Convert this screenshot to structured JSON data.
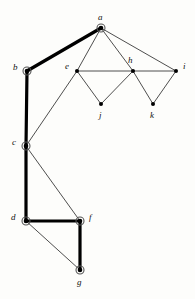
{
  "figure": {
    "width": 195,
    "height": 299,
    "background_color": "#fdfdfb",
    "edge_color_normal": "#3a3a3a",
    "edge_color_tree": "#000000",
    "node_fill": "#000000",
    "node_ring_color": "#555555",
    "label_color": "#111111"
  },
  "nodes": [
    {
      "id": "a",
      "label": "a",
      "x": 101,
      "y": 28,
      "label_x": 98,
      "label_y": 13,
      "ringed": true
    },
    {
      "id": "b",
      "label": "b",
      "x": 27,
      "y": 71,
      "label_x": 13,
      "label_y": 63,
      "ringed": true
    },
    {
      "id": "c",
      "label": "c",
      "x": 26,
      "y": 146,
      "label_x": 12,
      "label_y": 138,
      "ringed": true
    },
    {
      "id": "d",
      "label": "d",
      "x": 26,
      "y": 221,
      "label_x": 11,
      "label_y": 213,
      "ringed": true
    },
    {
      "id": "e",
      "label": "e",
      "x": 77,
      "y": 71,
      "label_x": 65,
      "label_y": 62,
      "ringed": false
    },
    {
      "id": "f",
      "label": "f",
      "x": 80,
      "y": 221,
      "label_x": 89,
      "label_y": 213,
      "ringed": true
    },
    {
      "id": "g",
      "label": "g",
      "x": 80,
      "y": 270,
      "label_x": 77,
      "label_y": 278,
      "ringed": true
    },
    {
      "id": "h",
      "label": "h",
      "x": 133,
      "y": 71,
      "label_x": 128,
      "label_y": 56,
      "ringed": false
    },
    {
      "id": "i",
      "label": "i",
      "x": 176,
      "y": 71,
      "label_x": 183,
      "label_y": 62,
      "ringed": false
    },
    {
      "id": "j",
      "label": "j",
      "x": 101,
      "y": 104,
      "label_x": 99,
      "label_y": 111,
      "ringed": false
    },
    {
      "id": "k",
      "label": "k",
      "x": 153,
      "y": 104,
      "label_x": 150,
      "label_y": 111,
      "ringed": false
    }
  ],
  "edges": [
    {
      "id": "a-b",
      "from": "a",
      "to": "b",
      "in_tree": true
    },
    {
      "id": "a-e",
      "from": "a",
      "to": "e",
      "in_tree": false
    },
    {
      "id": "a-h",
      "from": "a",
      "to": "h",
      "in_tree": false
    },
    {
      "id": "a-i",
      "from": "a",
      "to": "i",
      "in_tree": false
    },
    {
      "id": "b-c",
      "from": "b",
      "to": "c",
      "in_tree": true
    },
    {
      "id": "c-e",
      "from": "c",
      "to": "e",
      "in_tree": false
    },
    {
      "id": "c-d",
      "from": "c",
      "to": "d",
      "in_tree": true
    },
    {
      "id": "c-f",
      "from": "c",
      "to": "f",
      "in_tree": false
    },
    {
      "id": "d-f",
      "from": "d",
      "to": "f",
      "in_tree": true
    },
    {
      "id": "d-g",
      "from": "d",
      "to": "g",
      "in_tree": false
    },
    {
      "id": "f-g",
      "from": "f",
      "to": "g",
      "in_tree": true
    },
    {
      "id": "e-h",
      "from": "e",
      "to": "h",
      "in_tree": false
    },
    {
      "id": "e-j",
      "from": "e",
      "to": "j",
      "in_tree": false
    },
    {
      "id": "j-h",
      "from": "j",
      "to": "h",
      "in_tree": false
    },
    {
      "id": "h-i",
      "from": "h",
      "to": "i",
      "in_tree": false
    },
    {
      "id": "h-k",
      "from": "h",
      "to": "k",
      "in_tree": false
    },
    {
      "id": "k-i",
      "from": "k",
      "to": "i",
      "in_tree": false
    }
  ]
}
